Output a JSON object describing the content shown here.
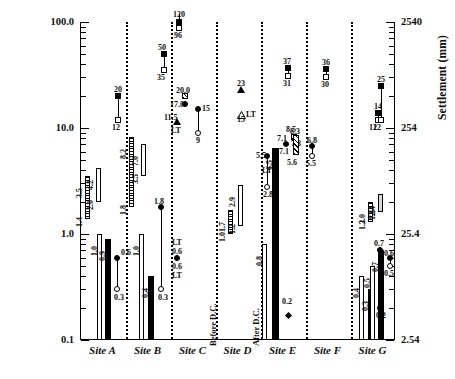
{
  "chart_data": {
    "type": "bar",
    "title": "",
    "ylabel": "Settlement (in)",
    "ylabel_right": "Settlement (mm)",
    "xlabel": "",
    "yscale": "log",
    "ylim": [
      0.1,
      100.0
    ],
    "ylim_right": [
      2.54,
      2540
    ],
    "yticks_left": [
      "100.0",
      "10.0",
      "1.0",
      "0.1"
    ],
    "yticks_right": [
      "2540",
      "254",
      "25.4",
      "2.54"
    ],
    "grid": false,
    "legend": "none",
    "categories": [
      "Site A",
      "Site B",
      "Site C",
      "Site D",
      "Site E",
      "Site F",
      "Site G"
    ],
    "annotations": [
      "Before D.C.",
      "After D.C.",
      "LT"
    ],
    "series": [
      {
        "name": "Site A",
        "items": [
          {
            "kind": "range-bar",
            "style": "hatch-vertical",
            "low": 1.4,
            "high": 3.5,
            "low_label": "1.4",
            "high_label": "3.5"
          },
          {
            "kind": "range-bar",
            "style": "open",
            "low": 2.0,
            "high": 4.2,
            "low_label": "2.0",
            "high_label": "4.2"
          },
          {
            "kind": "bar",
            "style": "open",
            "value": 1.0,
            "label": "1.0"
          },
          {
            "kind": "bar",
            "style": "solid",
            "value": 0.9,
            "label": "0.9"
          },
          {
            "kind": "stem",
            "top": 0.6,
            "bottom": 0.3,
            "top_marker": "filled-circle",
            "bottom_marker": "open-circle",
            "top_label": "0.6",
            "bottom_label": "0.3"
          },
          {
            "kind": "stem",
            "top": 20,
            "bottom": 12,
            "top_marker": "filled-square",
            "bottom_marker": "open-square",
            "top_label": "20",
            "bottom_label": "12"
          }
        ]
      },
      {
        "name": "Site B",
        "items": [
          {
            "kind": "range-bar",
            "style": "hatch-vertical",
            "low": 1.8,
            "high": 8.2,
            "low_label": "1.8",
            "high_label": "8.2"
          },
          {
            "kind": "range-bar",
            "style": "open",
            "low": 3.5,
            "high": 7.0,
            "low_label": "3.5",
            "high_label": "7.0"
          },
          {
            "kind": "bar",
            "style": "open",
            "value": 1.0,
            "label": "1.0"
          },
          {
            "kind": "bar",
            "style": "solid",
            "value": 0.4,
            "label": "0.4"
          },
          {
            "kind": "stem",
            "top": 1.8,
            "bottom": 0.3,
            "top_marker": "filled-circle",
            "bottom_marker": "open-circle",
            "top_label": "1.8",
            "bottom_label": "0.3"
          },
          {
            "kind": "stem",
            "top": 50,
            "bottom": 35,
            "top_marker": "filled-square",
            "bottom_marker": "open-square",
            "top_label": "50",
            "bottom_label": "35"
          }
        ]
      },
      {
        "name": "Site C",
        "items": [
          {
            "kind": "stem",
            "top": 120,
            "bottom": 96,
            "top_marker": "filled-square",
            "bottom_marker": "open-square",
            "top_label": "120",
            "bottom_label": "96"
          },
          {
            "kind": "marker",
            "style": "hatch-square",
            "value": 20.0,
            "label": "20.0"
          },
          {
            "kind": "marker",
            "style": "filled-circle",
            "value": 17.0,
            "label": "17.0"
          },
          {
            "kind": "marker",
            "style": "up-triangle",
            "value": 11.5,
            "label": "11.5",
            "sublabel": "LT"
          },
          {
            "kind": "stem",
            "top": 15,
            "bottom": 9,
            "top_marker": "filled-circle",
            "bottom_marker": "open-circle",
            "top_label": "15",
            "bottom_label": "9"
          },
          {
            "kind": "marker",
            "style": "filled-circle",
            "value": 0.6,
            "label": "0.6",
            "uplabel": "LT",
            "sublabel2": "0.6",
            "sublabel3": "LT"
          }
        ]
      },
      {
        "name": "Site D",
        "items": [
          {
            "kind": "range-bar",
            "style": "hatch-vertical",
            "low": 1.0,
            "high": 1.7,
            "low_label": "1.0",
            "high_label": "1.7",
            "phase": "Before D.C."
          },
          {
            "kind": "range-bar",
            "style": "open",
            "low": 1.2,
            "high": 2.9,
            "low_label": "1.2",
            "high_label": "2.9",
            "phase": "Before D.C."
          },
          {
            "kind": "marker",
            "style": "up-triangle",
            "value": 23,
            "label": "23"
          },
          {
            "kind": "marker",
            "style": "up-triangle-open",
            "value": 15,
            "label": "15",
            "sublabel": "LT"
          },
          {
            "kind": "stem",
            "top": 5.5,
            "bottom": 2.8,
            "top_marker": "filled-circle",
            "bottom_marker": "open-circle",
            "top_label": "5.5",
            "bottom_label": "2.8",
            "midlabel": "LT",
            "phase": "After D.C."
          },
          {
            "kind": "bar",
            "style": "open",
            "value": 0.8,
            "label": "0.8",
            "phase": "After D.C."
          },
          {
            "kind": "bar",
            "style": "solid",
            "value": 6.5,
            "label": "6.5",
            "phase": "After D.C."
          },
          {
            "kind": "marker",
            "style": "filled-circle",
            "value": 7.1,
            "label": "7.1",
            "label2": "7.1"
          },
          {
            "kind": "marker",
            "style": "hatch-square",
            "value": 8.3,
            "label": "8.3",
            "sublabel": "7.3"
          },
          {
            "kind": "stem",
            "top": 37,
            "bottom": 31,
            "top_marker": "filled-square",
            "bottom_marker": "open-square",
            "top_label": "37",
            "bottom_label": "31"
          },
          {
            "kind": "marker",
            "style": "filled-diamond",
            "value": 0.2,
            "label": "0.2"
          }
        ]
      },
      {
        "name": "Site E",
        "items": [
          {
            "kind": "range-bar",
            "style": "hatch-diagonal",
            "low": 5.6,
            "high": 8.5,
            "low_label": "5.6",
            "high_label": "8.5"
          },
          {
            "kind": "stem",
            "top": 6.8,
            "bottom": 5.5,
            "top_marker": "filled-circle",
            "bottom_marker": "open-circle",
            "top_label": "6.8",
            "bottom_label": "5.5"
          },
          {
            "kind": "stem",
            "top": 36,
            "bottom": 30,
            "top_marker": "filled-square",
            "bottom_marker": "open-square",
            "top_label": "36",
            "bottom_label": "30"
          }
        ]
      },
      {
        "name": "Site F",
        "items": [
          {
            "kind": "bar",
            "style": "open",
            "value": 0.4,
            "label": "0.4"
          },
          {
            "kind": "bar",
            "style": "solid",
            "value": 0.3,
            "label": "0.3"
          },
          {
            "kind": "stem",
            "top": 0.7,
            "bottom": 0.2,
            "top_marker": "filled-circle",
            "bottom_marker": "open-circle",
            "top_label": "0.7",
            "bottom_label": "0.2"
          },
          {
            "kind": "stem",
            "top": 14,
            "bottom": 12,
            "top_marker": "filled-square",
            "bottom_marker": "open-square",
            "top_label": "14",
            "bottom_label": "12"
          }
        ]
      },
      {
        "name": "Site G",
        "items": [
          {
            "kind": "range-bar",
            "style": "hatch-vertical",
            "low": 1.3,
            "high": 2.0,
            "low_label": "1.3",
            "high_label": "2.0"
          },
          {
            "kind": "range-bar",
            "style": "light-grey",
            "low": 1.6,
            "high": 2.4,
            "low_label": "1.6",
            "high_label": "2.4"
          },
          {
            "kind": "bar",
            "style": "open",
            "value": 0.5,
            "label": "0.5"
          },
          {
            "kind": "bar",
            "style": "solid",
            "value": 0.7,
            "label": "0.7"
          },
          {
            "kind": "stem",
            "top": 0.6,
            "bottom": 0.5,
            "top_marker": "filled-circle",
            "bottom_marker": "open-circle",
            "top_label": "0.6",
            "bottom_label": "0.5"
          },
          {
            "kind": "stem",
            "top": 25,
            "bottom": 12,
            "top_marker": "filled-square",
            "bottom_marker": "open-square",
            "top_label": "25",
            "bottom_label": "12"
          }
        ]
      }
    ]
  },
  "axis": {
    "left_title": "Settlement (in)",
    "right_title": "Settlement (mm)",
    "left_ticks": [
      {
        "label": "100.0"
      },
      {
        "label": "10.0"
      },
      {
        "label": "1.0"
      },
      {
        "label": "0.1"
      }
    ],
    "right_ticks": [
      {
        "label": "2540"
      },
      {
        "label": "254"
      },
      {
        "label": "25.4"
      },
      {
        "label": "2.54"
      }
    ]
  },
  "sites": [
    {
      "label": "Site A"
    },
    {
      "label": "Site B"
    },
    {
      "label": "Site C"
    },
    {
      "label": "Site D"
    },
    {
      "label": "Site E"
    },
    {
      "label": "Site F"
    },
    {
      "label": "Site G"
    }
  ],
  "annotations": {
    "before_dc": "Before D.C.",
    "after_dc": "After D.C.",
    "lt": "LT"
  },
  "labels": {
    "a_hatch_lo": "1.4",
    "a_hatch_hi": "3.5",
    "a_open_lo": "2.0",
    "a_open_hi": "4.2",
    "a_bar1": "1.0",
    "a_bar2": "0.9",
    "a_stem_hi": "0.6",
    "a_stem_lo": "0.3",
    "a_sq_hi": "20",
    "a_sq_lo": "12",
    "b_hatch_lo": "1.8",
    "b_hatch_hi": "8.2",
    "b_open_lo": "3.5",
    "b_open_hi": "7.0",
    "b_bar1": "1.0",
    "b_bar2": "0.4",
    "b_stem_hi": "1.8",
    "b_stem_lo": "0.3",
    "b_sq_hi": "50",
    "b_sq_lo": "35",
    "c_sq_hi": "120",
    "c_sq_lo": "96",
    "c_m1": "20.0",
    "c_m2": "17.0",
    "c_m3": "11.5",
    "c_m3b": "LT",
    "c_stem_hi": "15",
    "c_stem_lo": "9",
    "c_lt1": "LT",
    "c_v1": "0.6",
    "c_v2": "0.6",
    "c_lt2": "LT",
    "d_hatch_lo": "1.0",
    "d_hatch_hi": "1.7",
    "d_open_lo": "1.2",
    "d_open_hi": "2.9",
    "d_tri1": "23",
    "d_tri2": "15",
    "d_tri2b": "LT",
    "d_stem_hi": "5.5",
    "d_stem_lo": "2.8",
    "d_stem_mid": "LT",
    "d_bar_open": "0.8",
    "d_bar_solid": "6.5",
    "d_c1": "7.1",
    "d_c2": "7.1",
    "d_s1": "8.3",
    "d_s2": "7.3",
    "d_sq_hi": "37",
    "d_sq_lo": "31",
    "d_diamond": "0.2",
    "e_hatch_lo": "5.6",
    "e_hatch_hi": "8.5",
    "e_stem_hi": "6.8",
    "e_stem_lo": "5.5",
    "e_sq_hi": "36",
    "e_sq_lo": "30",
    "f_bar1": "0.4",
    "f_bar2": "0.3",
    "f_stem_hi": "0.7",
    "f_stem_lo": "0.2",
    "f_sq_hi": "14",
    "f_sq_lo": "12",
    "g_hatch_lo": "1.3",
    "g_hatch_hi": "2.0",
    "g_open_lo": "1.6",
    "g_open_hi": "2.4",
    "g_bar1": "0.5",
    "g_bar2": "0.7",
    "g_stem_hi": "0.6",
    "g_stem_lo": "0.5",
    "g_sq_hi": "25",
    "g_sq_lo": "12"
  }
}
